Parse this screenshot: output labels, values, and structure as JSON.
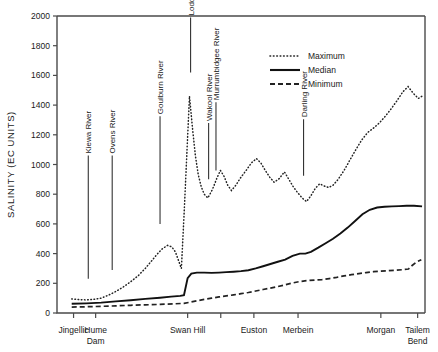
{
  "chart_data": {
    "type": "line",
    "title": "",
    "xlabel": "",
    "ylabel": "SALINITY (EC UNITS)",
    "ylim": [
      0,
      2000
    ],
    "ytick_step": 200,
    "yticks": [
      0,
      200,
      400,
      600,
      800,
      1000,
      1200,
      1400,
      1600,
      1800,
      2000
    ],
    "grid": false,
    "legend_position": "top-right",
    "xlim": [
      0,
      100
    ],
    "categories": [
      "Jingellic",
      "Hume Dam",
      "Swan Hill",
      "Euston",
      "Merbein",
      "Morgan",
      "Tailem Bend"
    ],
    "xtick_labels": [
      {
        "label": "Jingellic",
        "line2": "",
        "x": 4.5
      },
      {
        "label": "Hume",
        "line2": "Dam",
        "x": 10.5
      },
      {
        "label": "Swan Hill",
        "line2": "",
        "x": 35.5
      },
      {
        "label": "Euston",
        "line2": "",
        "x": 53.5
      },
      {
        "label": "Merbein",
        "line2": "",
        "x": 65.5
      },
      {
        "label": "Morgan",
        "line2": "",
        "x": 88.0
      },
      {
        "label": "Tailem",
        "line2": "Bend",
        "x": 98.0
      }
    ],
    "xticks": [
      4.5,
      10.5,
      35.5,
      44.5,
      53.5,
      65.5,
      88.0,
      98.0
    ],
    "series": [
      {
        "name": "Maximum",
        "style": "dotted",
        "points": [
          [
            4.0,
            95
          ],
          [
            6.0,
            90
          ],
          [
            8.0,
            88
          ],
          [
            10.0,
            92
          ],
          [
            12.0,
            100
          ],
          [
            14.0,
            120
          ],
          [
            16.0,
            145
          ],
          [
            18.0,
            175
          ],
          [
            20.0,
            210
          ],
          [
            22.0,
            250
          ],
          [
            24.0,
            300
          ],
          [
            25.5,
            345
          ],
          [
            27.0,
            390
          ],
          [
            28.5,
            430
          ],
          [
            30.0,
            455
          ],
          [
            31.2,
            445
          ],
          [
            32.2,
            410
          ],
          [
            33.0,
            355
          ],
          [
            33.8,
            300
          ],
          [
            34.6,
            700
          ],
          [
            35.3,
            1080
          ],
          [
            36.0,
            1460
          ],
          [
            36.8,
            1250
          ],
          [
            37.6,
            1060
          ],
          [
            38.4,
            930
          ],
          [
            39.2,
            850
          ],
          [
            40.0,
            800
          ],
          [
            41.0,
            775
          ],
          [
            42.2,
            830
          ],
          [
            43.4,
            905
          ],
          [
            44.4,
            960
          ],
          [
            45.4,
            920
          ],
          [
            46.4,
            860
          ],
          [
            47.4,
            825
          ],
          [
            48.6,
            860
          ],
          [
            50.0,
            915
          ],
          [
            51.4,
            960
          ],
          [
            52.8,
            1010
          ],
          [
            54.2,
            1040
          ],
          [
            55.4,
            1010
          ],
          [
            56.6,
            960
          ],
          [
            57.8,
            915
          ],
          [
            59.0,
            880
          ],
          [
            60.4,
            905
          ],
          [
            61.8,
            950
          ],
          [
            63.0,
            900
          ],
          [
            64.2,
            850
          ],
          [
            65.4,
            810
          ],
          [
            66.6,
            775
          ],
          [
            67.8,
            750
          ],
          [
            69.0,
            790
          ],
          [
            70.2,
            840
          ],
          [
            71.4,
            870
          ],
          [
            72.6,
            855
          ],
          [
            73.8,
            845
          ],
          [
            75.0,
            860
          ],
          [
            76.4,
            900
          ],
          [
            78.0,
            960
          ],
          [
            79.6,
            1030
          ],
          [
            81.2,
            1100
          ],
          [
            82.8,
            1165
          ],
          [
            84.4,
            1215
          ],
          [
            86.0,
            1245
          ],
          [
            87.6,
            1280
          ],
          [
            89.2,
            1325
          ],
          [
            90.8,
            1375
          ],
          [
            92.4,
            1430
          ],
          [
            94.0,
            1490
          ],
          [
            95.4,
            1525
          ],
          [
            96.8,
            1480
          ],
          [
            98.2,
            1445
          ],
          [
            99.2,
            1460
          ]
        ]
      },
      {
        "name": "Median",
        "style": "solid",
        "points": [
          [
            4.0,
            62
          ],
          [
            8.0,
            65
          ],
          [
            12.0,
            70
          ],
          [
            16.0,
            78
          ],
          [
            20.0,
            86
          ],
          [
            24.0,
            95
          ],
          [
            28.0,
            103
          ],
          [
            31.0,
            110
          ],
          [
            33.5,
            115
          ],
          [
            34.5,
            120
          ],
          [
            35.5,
            235
          ],
          [
            36.5,
            265
          ],
          [
            38.0,
            272
          ],
          [
            40.0,
            272
          ],
          [
            42.0,
            270
          ],
          [
            44.0,
            272
          ],
          [
            46.0,
            275
          ],
          [
            48.0,
            278
          ],
          [
            50.0,
            282
          ],
          [
            52.0,
            288
          ],
          [
            54.0,
            300
          ],
          [
            56.0,
            315
          ],
          [
            58.0,
            330
          ],
          [
            60.0,
            345
          ],
          [
            62.0,
            360
          ],
          [
            64.0,
            385
          ],
          [
            66.0,
            400
          ],
          [
            67.5,
            400
          ],
          [
            69.0,
            412
          ],
          [
            71.0,
            440
          ],
          [
            73.0,
            470
          ],
          [
            75.0,
            500
          ],
          [
            77.0,
            535
          ],
          [
            79.0,
            575
          ],
          [
            81.0,
            620
          ],
          [
            83.0,
            665
          ],
          [
            85.0,
            695
          ],
          [
            87.0,
            710
          ],
          [
            89.0,
            715
          ],
          [
            91.0,
            718
          ],
          [
            93.0,
            720
          ],
          [
            95.0,
            722
          ],
          [
            97.0,
            722
          ],
          [
            99.2,
            718
          ]
        ]
      },
      {
        "name": "Minimum",
        "style": "dashed",
        "points": [
          [
            4.0,
            40
          ],
          [
            8.0,
            42
          ],
          [
            12.0,
            45
          ],
          [
            16.0,
            48
          ],
          [
            20.0,
            52
          ],
          [
            24.0,
            55
          ],
          [
            28.0,
            58
          ],
          [
            32.0,
            62
          ],
          [
            34.5,
            65
          ],
          [
            36.0,
            72
          ],
          [
            38.0,
            82
          ],
          [
            40.0,
            92
          ],
          [
            42.0,
            100
          ],
          [
            44.0,
            108
          ],
          [
            46.0,
            115
          ],
          [
            48.0,
            122
          ],
          [
            50.0,
            130
          ],
          [
            52.0,
            138
          ],
          [
            54.0,
            148
          ],
          [
            56.0,
            158
          ],
          [
            58.0,
            168
          ],
          [
            60.0,
            178
          ],
          [
            62.0,
            190
          ],
          [
            64.0,
            202
          ],
          [
            66.0,
            212
          ],
          [
            68.0,
            218
          ],
          [
            70.0,
            222
          ],
          [
            72.0,
            225
          ],
          [
            74.0,
            232
          ],
          [
            76.0,
            240
          ],
          [
            78.0,
            250
          ],
          [
            80.0,
            258
          ],
          [
            82.0,
            265
          ],
          [
            84.0,
            272
          ],
          [
            86.0,
            278
          ],
          [
            88.0,
            282
          ],
          [
            90.0,
            285
          ],
          [
            92.0,
            288
          ],
          [
            94.0,
            292
          ],
          [
            95.5,
            296
          ],
          [
            96.5,
            320
          ],
          [
            97.8,
            345
          ],
          [
            99.0,
            358
          ]
        ]
      }
    ],
    "annotations": [
      {
        "label": "Kiewa River",
        "x": 8.5,
        "leader_top": 1060,
        "leader_bottom": 230
      },
      {
        "label": "Ovens River",
        "x": 15.0,
        "leader_top": 1060,
        "leader_bottom": 290
      },
      {
        "label": "Goulburn River",
        "x": 28.0,
        "leader_top": 1325,
        "leader_bottom": 600
      },
      {
        "label": "Loddon River",
        "x": 36.3,
        "leader_top": 1990,
        "leader_bottom": 1620
      },
      {
        "label": "Wakool River",
        "x": 41.2,
        "leader_top": 1280,
        "leader_bottom": 900
      },
      {
        "label": "Murrumbidgee River",
        "x": 43.2,
        "leader_top": 1420,
        "leader_bottom": 960
      },
      {
        "label": "Darling River",
        "x": 67.0,
        "leader_top": 1305,
        "leader_bottom": 925
      }
    ],
    "legend": [
      {
        "label": "Maximum",
        "style": "dotted"
      },
      {
        "label": "Median",
        "style": "solid"
      },
      {
        "label": "Minimum",
        "style": "dashed"
      }
    ],
    "colors": {
      "ink": "#111111",
      "axis": "#4a4a4a",
      "background": "#ffffff"
    }
  }
}
